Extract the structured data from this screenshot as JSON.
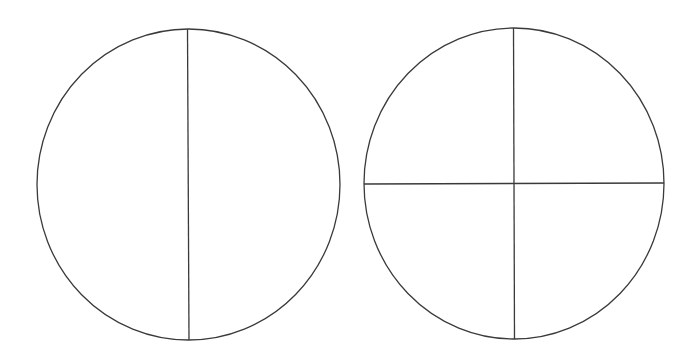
{
  "diagram": {
    "stroke_color": "#3a3a3a",
    "background": "#ffffff",
    "shapes": [
      {
        "id": "halves-circle",
        "parts": 2,
        "cx": 188.5,
        "cy": 184.5,
        "rx": 151.5,
        "ry": 155.5,
        "lines": [
          {
            "x1": 187.5,
            "y1": 29,
            "x2": 189,
            "y2": 340
          }
        ]
      },
      {
        "id": "quarters-circle",
        "parts": 4,
        "cx": 514,
        "cy": 183.5,
        "rx": 150,
        "ry": 155.5,
        "lines": [
          {
            "x1": 513.5,
            "y1": 28,
            "x2": 514.5,
            "y2": 339
          },
          {
            "x1": 364,
            "y1": 184,
            "x2": 664,
            "y2": 183
          }
        ]
      }
    ]
  }
}
